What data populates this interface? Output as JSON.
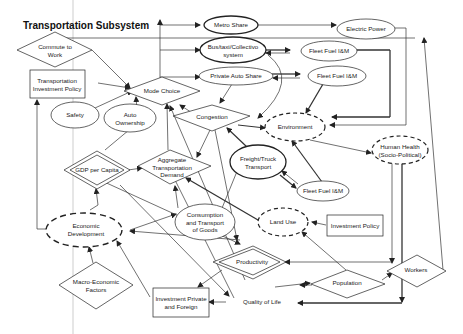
{
  "diagram": {
    "title": "Transportation Subsystem",
    "nodes": {
      "commute_to_work": {
        "label_line1": "Commute to",
        "label_line2": "Work",
        "shape": "diamond"
      },
      "transportation_investment_policy": {
        "label_line1": "Transportation",
        "label_line2": "Investment Policy",
        "shape": "rectangle"
      },
      "safety": {
        "label": "Safety",
        "shape": "ellipse"
      },
      "auto_ownership": {
        "label_line1": "Auto",
        "label_line2": "Ownership",
        "shape": "ellipse"
      },
      "mode_choice": {
        "label": "Mode Choice",
        "shape": "diamond"
      },
      "metro_share": {
        "label": "Metro Share",
        "shape": "ellipse-bold"
      },
      "bus_taxi_collectivo": {
        "label_line1": "Bus/taxi/Collectivo",
        "label_line2": "system",
        "shape": "ellipse-bold"
      },
      "private_auto_share": {
        "label": "Private Auto Share",
        "shape": "ellipse"
      },
      "electric_power": {
        "label": "Electric Power",
        "shape": "ellipse"
      },
      "fleet_fuel_im_1": {
        "label": "Fleet Fuel I&M",
        "shape": "ellipse"
      },
      "fleet_fuel_im_2": {
        "label": "Fleet Fuel I&M",
        "shape": "ellipse"
      },
      "fleet_fuel_im_3": {
        "label": "Fleet Fuel I&M",
        "shape": "ellipse"
      },
      "congestion": {
        "label": "Congestion",
        "shape": "diamond"
      },
      "environment": {
        "label": "Environment",
        "shape": "ellipse-dashed"
      },
      "human_health": {
        "label_line1": "Human Health",
        "label_line2": "(Socio-Political)",
        "shape": "ellipse-dashed"
      },
      "gdp_per_capita": {
        "label": "GDP per Capita",
        "shape": "diamond-double"
      },
      "aggregate_transportation_demand": {
        "label_line1": "Aggregate",
        "label_line2": "Transportation",
        "label_line3": "Demand",
        "shape": "diamond"
      },
      "freight_truck_transport": {
        "label_line1": "Freight/Truck",
        "label_line2": "Transport",
        "shape": "ellipse-bold"
      },
      "economic_development": {
        "label_line1": "Economic",
        "label_line2": "Development",
        "shape": "ellipse-dashed"
      },
      "consumption_transport_goods": {
        "label_line1": "Consumption",
        "label_line2": "and Transport",
        "label_line3": "of Goods",
        "shape": "ellipse"
      },
      "land_use": {
        "label": "Land Use",
        "shape": "ellipse-dashed"
      },
      "investment_policy": {
        "label": "Investment Policy",
        "shape": "rectangle"
      },
      "productivity": {
        "label": "Productivity",
        "shape": "diamond-double"
      },
      "macro_economic_factors": {
        "label_line1": "Macro-Economic",
        "label_line2": "Factors",
        "shape": "diamond"
      },
      "investment_private_foreign": {
        "label_line1": "Investment Private",
        "label_line2": "and Foreign",
        "shape": "rectangle"
      },
      "quality_of_life": {
        "label": "Quality of Life",
        "shape": "text"
      },
      "population": {
        "label": "Population",
        "shape": "diamond"
      },
      "workers": {
        "label": "Workers",
        "shape": "diamond"
      }
    },
    "colors": {
      "stroke": "#222222",
      "background": "#ffffff",
      "text": "#1a1a1a"
    }
  }
}
